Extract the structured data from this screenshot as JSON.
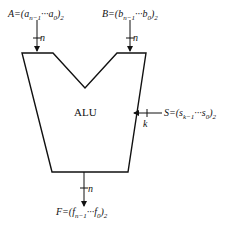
{
  "diagram": {
    "title": "ALU",
    "inputs": [
      {
        "name": "A",
        "label_main": "A=(a",
        "sub1": "n−1",
        "mid": "···a",
        "sub2": "0",
        "end": ")",
        "base": "2",
        "width_label": "n"
      },
      {
        "name": "B",
        "label_main": "B=(b",
        "sub1": "n−1",
        "mid": "···b",
        "sub2": "0",
        "end": ")",
        "base": "2",
        "width_label": "n"
      }
    ],
    "select": {
      "name": "S",
      "label_main": "S=(s",
      "sub1": "k−1",
      "mid": "···s",
      "sub2": "0",
      "end": ")",
      "base": "2",
      "width_label": "k"
    },
    "output": {
      "name": "F",
      "label_main": "F=(f",
      "sub1": "n−1",
      "mid": "···f",
      "sub2": "0",
      "end": ")",
      "base": "2",
      "width_label": "n"
    }
  }
}
